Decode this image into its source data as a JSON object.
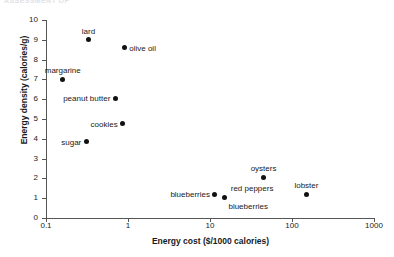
{
  "header": {
    "clipped_text": "ASSESSMENT OF"
  },
  "chart_data": {
    "type": "scatter",
    "title": "",
    "xlabel": "Energy cost ($/1000 calories)",
    "ylabel": "Energy density (calories/g)",
    "xscale": "log",
    "yscale": "linear",
    "xlim": [
      0.1,
      1000
    ],
    "ylim": [
      0,
      10
    ],
    "grid": false,
    "legend": "none",
    "xticks": [
      "0.1",
      "1",
      "10",
      "100",
      "1000"
    ],
    "xtick_values": [
      0.1,
      1,
      10,
      100,
      1000
    ],
    "yticks": [
      "0",
      "1",
      "2",
      "3",
      "4",
      "5",
      "6",
      "7",
      "8",
      "9",
      "10"
    ],
    "ytick_values": [
      0,
      1,
      2,
      3,
      4,
      5,
      6,
      7,
      8,
      9,
      10
    ],
    "marker_color": "#111111",
    "axis_color": "#555555",
    "points": [
      {
        "label": "lard",
        "x": 0.33,
        "y": 9.0,
        "label_pos": "above"
      },
      {
        "label": "olive oil",
        "x": 0.9,
        "y": 8.6,
        "label_pos": "right"
      },
      {
        "label": "margarine",
        "x": 0.16,
        "y": 7.0,
        "label_pos": "above"
      },
      {
        "label": "peanut butter",
        "x": 0.7,
        "y": 6.05,
        "label_pos": "left"
      },
      {
        "label": "cookies",
        "x": 0.86,
        "y": 4.75,
        "label_pos": "left"
      },
      {
        "label": "sugar",
        "x": 0.31,
        "y": 3.85,
        "label_pos": "left"
      },
      {
        "label": "oysters",
        "x": 45,
        "y": 2.05,
        "label_pos": "above"
      },
      {
        "label": "blueberries",
        "x": 11.5,
        "y": 1.2,
        "label_pos": "left"
      },
      {
        "label": "lobster",
        "x": 150,
        "y": 1.2,
        "label_pos": "above"
      },
      {
        "label": "red peppers",
        "x": 15,
        "y": 1.05,
        "label_pos": "above-right"
      },
      {
        "label": "blueberries",
        "x": 15,
        "y": 1.05,
        "label_pos": "below-right"
      }
    ]
  }
}
